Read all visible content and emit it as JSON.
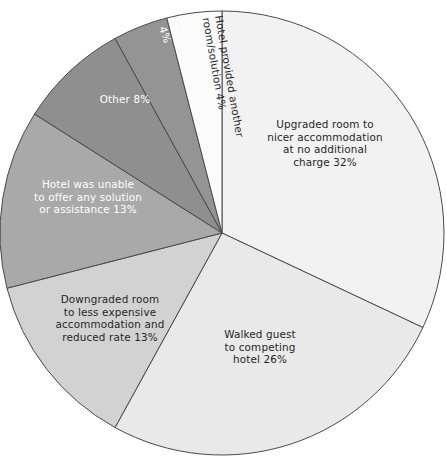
{
  "chart_data": {
    "type": "pie",
    "title": "",
    "xlabel": "",
    "ylabel": "",
    "legend_position": "none",
    "grid": false,
    "labels_inside": true,
    "start_angle_deg": 0,
    "direction": "clockwise",
    "categories": [
      "Upgraded room to nicer accommodation at no additional charge",
      "Walked guest to competing hotel",
      "Downgraded room to less expensive accommodation and reduced rate",
      "Hotel was unable to offer any solution or assistance",
      "Other",
      "Guest waited for room to become available",
      "Hotel provided another room/solution"
    ],
    "values": [
      32,
      26,
      13,
      13,
      8,
      4,
      4
    ],
    "unit": "%",
    "total": 100,
    "colors": [
      "#f2f2f2",
      "#e9e9e9",
      "#d2d2d2",
      "#a9a9a9",
      "#8f8f8f",
      "#949494",
      "#fbfbfb"
    ],
    "slices": [
      {
        "name": "upgraded-room",
        "label_lines": [
          "Upgraded room to",
          "nicer accommodation",
          "at no additional",
          "charge 32%"
        ],
        "value": 32,
        "percent_text": "32%",
        "color": "#f2f2f2",
        "text_color": "#262626",
        "label_x": 325,
        "label_y": 128,
        "rotation": 0,
        "anchor": "middle"
      },
      {
        "name": "walked-guest",
        "label_lines": [
          "Walked guest",
          "to competing",
          "hotel 26%"
        ],
        "value": 26,
        "percent_text": "26%",
        "color": "#e9e9e9",
        "text_color": "#262626",
        "label_x": 260,
        "label_y": 338,
        "rotation": 0,
        "anchor": "middle"
      },
      {
        "name": "downgraded-room",
        "label_lines": [
          "Downgraded room",
          "to less expensive",
          "accommodation and",
          "reduced rate 13%"
        ],
        "value": 13,
        "percent_text": "13%",
        "color": "#d2d2d2",
        "text_color": "#262626",
        "label_x": 110,
        "label_y": 303,
        "rotation": 0,
        "anchor": "middle"
      },
      {
        "name": "hotel-unable",
        "label_lines": [
          "Hotel was unable",
          "to offer any solution",
          "or assistance 13%"
        ],
        "value": 13,
        "percent_text": "13%",
        "color": "#a9a9a9",
        "text_color": "#ffffff",
        "label_x": 88,
        "label_y": 188,
        "rotation": 0,
        "anchor": "middle"
      },
      {
        "name": "other",
        "label_lines": [
          "Other 8%"
        ],
        "value": 8,
        "percent_text": "8%",
        "color": "#8f8f8f",
        "text_color": "#ffffff",
        "label_x": 125,
        "label_y": 103,
        "rotation": 0,
        "anchor": "middle"
      },
      {
        "name": "guest-waited",
        "label_lines": [
          "Guest waited for",
          "room to become available",
          "4%"
        ],
        "value": 4,
        "percent_text": "4%",
        "color": "#949494",
        "text_color": "#ffffff",
        "label_x": 183,
        "label_y": 20,
        "rotation": 72,
        "anchor": "start"
      },
      {
        "name": "hotel-provided-another",
        "label_lines": [
          "Hotel provided another",
          "room/solution 4%"
        ],
        "value": 4,
        "percent_text": "4%",
        "color": "#fbfbfb",
        "text_color": "#262626",
        "label_x": 215,
        "label_y": 16,
        "rotation": 80,
        "anchor": "start"
      }
    ]
  },
  "geometry": {
    "center_x": 222,
    "center_y": 233,
    "radius": 222
  }
}
